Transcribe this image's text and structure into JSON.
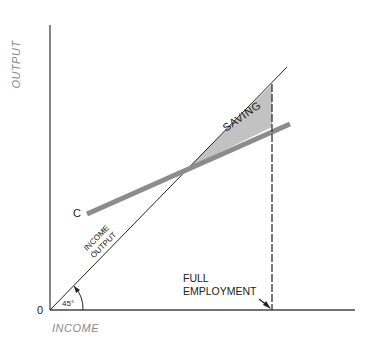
{
  "diagram": {
    "axes": {
      "y_label": "OUTPUT",
      "x_label": "INCOME",
      "origin_label": "0"
    },
    "lines": {
      "income_output": {
        "label_top": "INCOME",
        "label_bottom": "OUTPUT",
        "angle_label": "45°"
      },
      "consumption": {
        "label": "C"
      }
    },
    "region": {
      "label": "SAVING"
    },
    "marker": {
      "line1": "FULL",
      "line2": "EMPLOYMENT"
    }
  },
  "colors": {
    "axis": "#333333",
    "consumption_line": "#8c8c8c",
    "saving_fill": "#c2c2c2",
    "axis_label": "#8a8a8a"
  }
}
